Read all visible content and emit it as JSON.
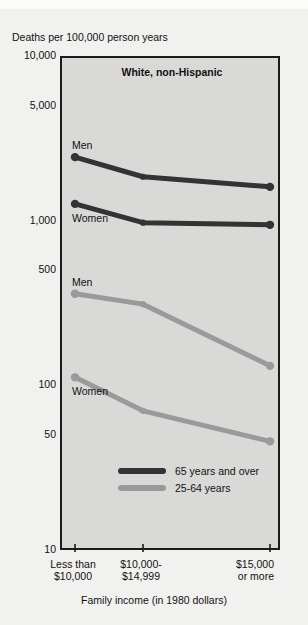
{
  "figure": {
    "cut_off_header": "",
    "y_axis_title": "Deaths per 100,000 person years",
    "x_axis_title": "Family income (in 1980 dollars)",
    "plot_title": "White, non-Hispanic"
  },
  "colors": {
    "plot_background": "#d9d9d7",
    "page_background": "#f1f1ef",
    "frame": "#1b1b1b",
    "series_65_and_over": "#333333",
    "series_25_64": "#9a9a9a"
  },
  "legend": {
    "position": "inside-bottom-left",
    "entries": [
      {
        "label": "65 years and over",
        "color": "#333333"
      },
      {
        "label": "25-64 years",
        "color": "#9a9a9a"
      }
    ]
  },
  "series_labels": [
    {
      "text": "Men",
      "series": "65 years and over"
    },
    {
      "text": "Women",
      "series": "65 years and over"
    },
    {
      "text": "Men",
      "series": "25-64 years"
    },
    {
      "text": "Women",
      "series": "25-64 years"
    }
  ],
  "chart_data": {
    "type": "line",
    "title": "White, non-Hispanic",
    "xlabel": "Family income (in 1980 dollars)",
    "ylabel": "Deaths per 100,000 person years",
    "yscale": "log",
    "ylim": [
      10,
      10000
    ],
    "ytick_labels": [
      "10,000",
      "5,000",
      "1,000",
      "500",
      "100",
      "50",
      "10"
    ],
    "ytick_values": [
      10000,
      5000,
      1000,
      500,
      100,
      50,
      10
    ],
    "grid": false,
    "categories": [
      "Less than $10,000",
      "$10,000-$14,999",
      "$15,000 or more"
    ],
    "xtick_labels": [
      [
        "Less than",
        "$10,000"
      ],
      [
        "$10,000-",
        "$14,999"
      ],
      [
        "$15,000",
        "or more"
      ]
    ],
    "series": [
      {
        "name": "Men, 65 years and over",
        "group": "65 years and over",
        "sex": "Men",
        "color": "#333333",
        "values": [
          2500,
          1900,
          1650
        ]
      },
      {
        "name": "Women, 65 years and over",
        "group": "65 years and over",
        "sex": "Women",
        "color": "#333333",
        "values": [
          1300,
          1000,
          970
        ]
      },
      {
        "name": "Men, 25-64 years",
        "group": "25-64 years",
        "sex": "Men",
        "color": "#9a9a9a",
        "values": [
          370,
          320,
          135
        ]
      },
      {
        "name": "Women, 25-64 years",
        "group": "25-64 years",
        "sex": "Women",
        "color": "#9a9a9a",
        "values": [
          115,
          72,
          47
        ]
      }
    ]
  }
}
